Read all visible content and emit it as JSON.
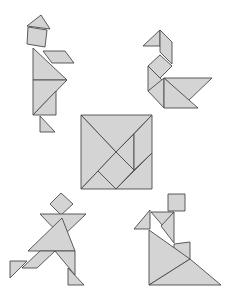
{
  "page": {
    "colors": {
      "piece_fill": "#d4d4d4",
      "piece_stroke": "#4a4a4a",
      "background": "#ffffff"
    }
  },
  "figures": [
    {
      "name": "standing-person",
      "pieces": [
        {
          "type": "small-triangle",
          "points": "27,26 41,15 50,29"
        },
        {
          "type": "square",
          "points": "28,27 47,30 45,47 27,44"
        },
        {
          "type": "parallelogram",
          "points": "43,51 65,51 74,63 52,63"
        },
        {
          "type": "large-triangle",
          "points": "33,48 33,80 67,80"
        },
        {
          "type": "large-triangle",
          "points": "33,80 67,80 33,115"
        },
        {
          "type": "medium-triangle",
          "points": "33,115 56,91 56,115"
        },
        {
          "type": "small-triangle",
          "points": "40,116 40,132 55,132"
        }
      ]
    },
    {
      "name": "swan",
      "pieces": [
        {
          "type": "small-triangle",
          "points": "143,46 160,30 160,46"
        },
        {
          "type": "parallelogram",
          "points": "160,30 172,42 172,64 160,52"
        },
        {
          "type": "square",
          "points": "148,66 160,55 172,66 160,78"
        },
        {
          "type": "small-triangle",
          "points": "148,66 164,82 148,91"
        },
        {
          "type": "medium-triangle",
          "points": "148,91 164,78 164,108"
        },
        {
          "type": "large-triangle",
          "points": "164,78 212,78 188,101"
        },
        {
          "type": "large-triangle",
          "points": "164,78 164,108 198,108"
        }
      ]
    },
    {
      "name": "solved-square",
      "pieces": [
        {
          "type": "large-triangle",
          "points": "81,115 152,115 116,152"
        },
        {
          "type": "large-triangle",
          "points": "81,115 116,152 81,189"
        },
        {
          "type": "small-triangle",
          "points": "116,152 134,134 134,170"
        },
        {
          "type": "parallelogram",
          "points": "134,134 152,115 152,153 134,170"
        },
        {
          "type": "square",
          "points": "98,171 116,152 134,170 116,189"
        },
        {
          "type": "small-triangle",
          "points": "81,189 98,171 116,189"
        },
        {
          "type": "medium-triangle",
          "points": "116,189 152,153 152,189"
        }
      ]
    },
    {
      "name": "running-person",
      "pieces": [
        {
          "type": "square",
          "points": "50,204 61,193 73,204 61,215"
        },
        {
          "type": "large-triangle",
          "points": "40,214 86,214 62,237"
        },
        {
          "type": "large-triangle",
          "points": "28,251 62,218 75,251"
        },
        {
          "type": "parallelogram",
          "points": "40,251 55,251 37,268 22,268"
        },
        {
          "type": "small-triangle",
          "points": "10,261 27,261 10,278"
        },
        {
          "type": "medium-triangle",
          "points": "55,251 75,251 75,275"
        },
        {
          "type": "small-triangle",
          "points": "68,268 68,285 84,285"
        }
      ]
    },
    {
      "name": "dancer-with-triangle",
      "pieces": [
        {
          "type": "square",
          "points": "168,194 185,194 185,211 168,211"
        },
        {
          "type": "small-triangle",
          "points": "134,229 150,210 150,229"
        },
        {
          "type": "small-triangle",
          "points": "151,212 174,212 163,226"
        },
        {
          "type": "medium-triangle",
          "points": "161,226 174,212 174,243"
        },
        {
          "type": "parallelogram",
          "points": "174,244 190,242 190,259 174,260"
        },
        {
          "type": "large-triangle",
          "points": "149,230 149,285 190,259"
        },
        {
          "type": "large-triangle",
          "points": "149,285 190,259 221,285"
        }
      ]
    }
  ]
}
